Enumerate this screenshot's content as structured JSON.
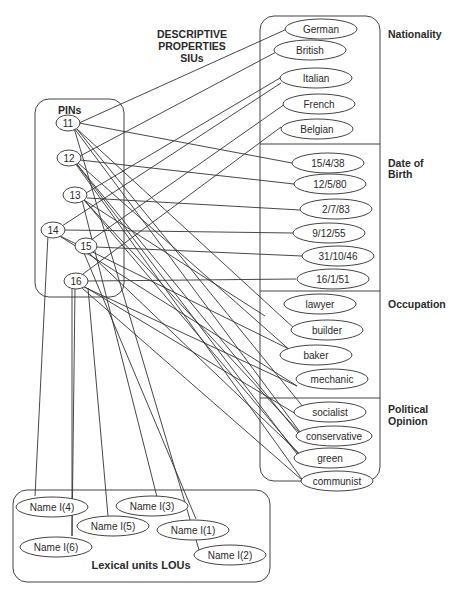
{
  "titles": {
    "descriptive_1": "DESCRIPTIVE",
    "descriptive_2": "PROPERTIES",
    "descriptive_3": "SIUs",
    "pins": "PINs",
    "lexical": "Lexical units LOUs"
  },
  "categories": {
    "nationality": "Nationality",
    "dob_1": "Date of",
    "dob_2": "Birth",
    "occupation": "Occupation",
    "political_1": "Political",
    "political_2": "Opinion"
  },
  "pins": [
    "11",
    "12",
    "13",
    "14",
    "15",
    "16"
  ],
  "properties": {
    "nationality": [
      "German",
      "British",
      "Italian",
      "French",
      "Belgian"
    ],
    "date_of_birth": [
      "15/4/38",
      "12/5/80",
      "2/7/83",
      "9/12/55",
      "31/10/46",
      "16/1/51"
    ],
    "occupation": [
      "lawyer",
      "builder",
      "baker",
      "mechanic"
    ],
    "political_opinion": [
      "socialist",
      "conservative",
      "green",
      "communist"
    ]
  },
  "lexical_units": [
    "Name I(4)",
    "Name I(3)",
    "Name I(5)",
    "Name I(1)",
    "Name I(6)",
    "Name I(2)"
  ],
  "colors": {
    "line": "#333333",
    "text": "#2a2a2a",
    "background": "#ffffff"
  }
}
